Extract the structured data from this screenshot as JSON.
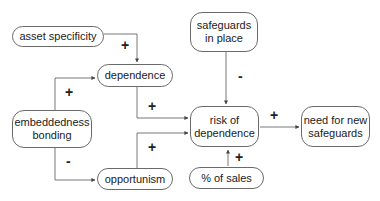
{
  "diagram": {
    "type": "causal-diagram",
    "nodes": {
      "asset_specificity": {
        "lines": [
          "asset specificity"
        ]
      },
      "dependence": {
        "lines": [
          "dependence"
        ]
      },
      "safeguards_in_place": {
        "lines": [
          "safeguards",
          "in place"
        ]
      },
      "embeddedness_bonding": {
        "lines": [
          "embeddedness",
          "bonding"
        ]
      },
      "risk_of_dependence": {
        "lines": [
          "risk of",
          "dependence"
        ]
      },
      "need_for_new_safeguards": {
        "lines": [
          "need for new",
          "safeguards"
        ]
      },
      "opportunism": {
        "lines": [
          "opportunism"
        ]
      },
      "pct_of_sales": {
        "lines": [
          "% of sales"
        ]
      }
    },
    "edges": [
      {
        "from": "asset specificity",
        "to": "dependence",
        "sign": "+"
      },
      {
        "from": "embeddedness bonding",
        "to": "dependence",
        "sign": "+"
      },
      {
        "from": "embeddedness bonding",
        "to": "opportunism",
        "sign": "-"
      },
      {
        "from": "dependence",
        "to": "risk of dependence",
        "sign": "+"
      },
      {
        "from": "opportunism",
        "to": "risk of dependence",
        "sign": "+"
      },
      {
        "from": "safeguards in place",
        "to": "risk of dependence",
        "sign": "-"
      },
      {
        "from": "% of sales",
        "to": "risk of dependence",
        "sign": "+"
      },
      {
        "from": "risk of dependence",
        "to": "need for new safeguards",
        "sign": "+"
      }
    ],
    "signs": {
      "asset_to_dependence": "+",
      "embed_to_dependence": "+",
      "embed_to_opportunism": "-",
      "dependence_to_risk": "+",
      "opportunism_to_risk": "+",
      "safeguards_to_risk": "-",
      "sales_to_risk": "+",
      "risk_to_need": "+"
    },
    "colors": {
      "line": "#555555",
      "border": "#6a6a6a",
      "text": "#1a1a1a"
    }
  }
}
